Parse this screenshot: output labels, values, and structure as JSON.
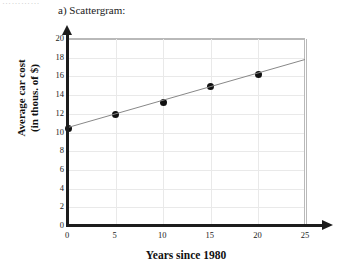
{
  "clip_fragment": "…………",
  "part_label": "a) Scattergram:",
  "chart_data": {
    "type": "scatter",
    "title": "a) Scattergram:",
    "xlabel": "Years since 1980",
    "ylabel": "Average car cost (in thous. of $)",
    "ylabel_line1": "Average car cost",
    "ylabel_line2": "(in thous. of $)",
    "xlim": [
      0,
      25
    ],
    "ylim": [
      0,
      20
    ],
    "xticks": [
      0,
      5,
      10,
      15,
      20,
      25
    ],
    "yticks": [
      0,
      2,
      4,
      6,
      8,
      10,
      12,
      14,
      16,
      18,
      20
    ],
    "grid": true,
    "legend": "none",
    "x": [
      0,
      5,
      10,
      15,
      20
    ],
    "values": [
      10.4,
      11.9,
      13.2,
      14.9,
      16.2
    ],
    "points": [
      {
        "x": 0,
        "y": 10.4
      },
      {
        "x": 5,
        "y": 11.9
      },
      {
        "x": 10,
        "y": 13.2
      },
      {
        "x": 15,
        "y": 14.9
      },
      {
        "x": 20,
        "y": 16.2
      }
    ],
    "trendline": {
      "type": "line",
      "x": [
        0,
        25
      ],
      "y": [
        10.4,
        17.7
      ],
      "color": "#888888"
    },
    "marker_color": "#111111",
    "grid_color": "#e9e9e9",
    "axis_color": "#1c1c1c"
  }
}
